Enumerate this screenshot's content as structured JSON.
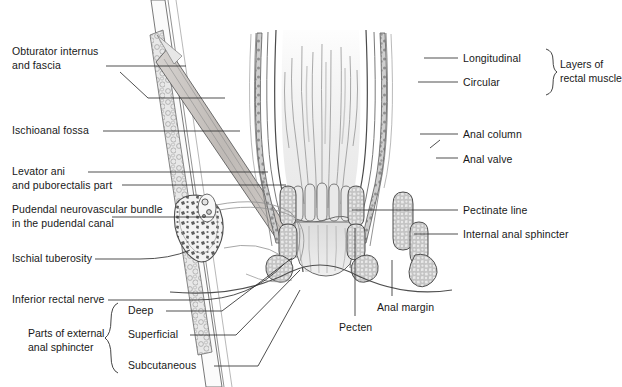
{
  "figure": {
    "type": "anatomical-illustration",
    "background": "#ffffff",
    "ink": "#181818",
    "palette": {
      "outline": "#555555",
      "muscle_fill": "#b9b9b9",
      "mucosa_fill": "#e2e2e2",
      "bone_fill": "#ececec",
      "stipple": "#8a8a8a",
      "leader": "#333333"
    }
  },
  "labels_left": [
    {
      "id": "obturator-internus",
      "text": "Obturator internus\nand fascia",
      "x": 12,
      "y": 45
    },
    {
      "id": "ischioanal-fossa",
      "text": "Ischioanal fossa",
      "x": 12,
      "y": 124
    },
    {
      "id": "levator-ani",
      "text": "Levator ani\nand puborectalis part",
      "x": 12,
      "y": 165
    },
    {
      "id": "pudendal-bundle",
      "text": "Pudendal neurovascular bundle\nin the pudendal canal",
      "x": 12,
      "y": 203
    },
    {
      "id": "ischial-tuberosity",
      "text": "Ischial tuberosity",
      "x": 12,
      "y": 252
    },
    {
      "id": "inferior-rectal-nerve",
      "text": "Inferior rectal nerve",
      "x": 12,
      "y": 293
    }
  ],
  "labels_right": [
    {
      "id": "longitudinal",
      "text": "Longitudinal",
      "x": 463,
      "y": 52
    },
    {
      "id": "circular",
      "text": "Circular",
      "x": 463,
      "y": 76
    },
    {
      "id": "anal-column",
      "text": "Anal column",
      "x": 463,
      "y": 128
    },
    {
      "id": "anal-valve",
      "text": "Anal valve",
      "x": 463,
      "y": 153
    },
    {
      "id": "pectinate-line",
      "text": "Pectinate line",
      "x": 463,
      "y": 204
    },
    {
      "id": "internal-anal-sphincter",
      "text": "Internal anal sphincter",
      "x": 463,
      "y": 228
    }
  ],
  "labels_bottom": [
    {
      "id": "pecten",
      "text": "Pecten",
      "x": 339,
      "y": 321
    },
    {
      "id": "anal-margin",
      "text": "Anal margin",
      "x": 377,
      "y": 301
    }
  ],
  "group_right": {
    "id": "layers-of-rectal-muscle",
    "text": "Layers of\nrectal muscle",
    "x": 527,
    "y": 52,
    "members": [
      "Longitudinal",
      "Circular"
    ]
  },
  "group_bottom": {
    "id": "parts-of-external-anal-sphincter",
    "text": "Parts of external\nanal sphincter",
    "x": 28,
    "y": 327,
    "members": [
      {
        "id": "deep",
        "text": "Deep",
        "x": 128,
        "y": 307
      },
      {
        "id": "superficial",
        "text": "Superficial",
        "x": 128,
        "y": 331
      },
      {
        "id": "subcutaneous",
        "text": "Subcutaneous",
        "x": 128,
        "y": 362
      }
    ]
  }
}
